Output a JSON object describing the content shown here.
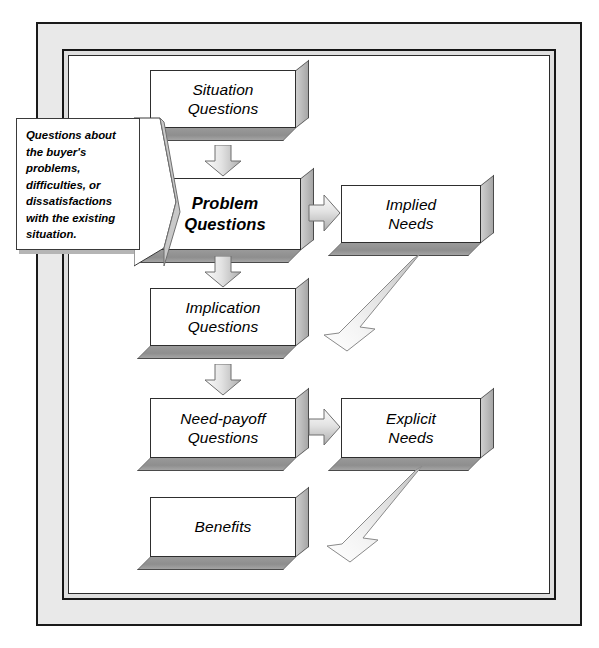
{
  "diagram": {
    "callout": {
      "text": "Questions about the buyer's problems, difficulties, or dissatisfactions with the existing situation."
    },
    "boxes": [
      {
        "id": "situation-questions",
        "line1": "Situation",
        "line2": "Questions",
        "emphasis": false
      },
      {
        "id": "problem-questions",
        "line1": "Problem",
        "line2": "Questions",
        "emphasis": true
      },
      {
        "id": "implication-questions",
        "line1": "Implication",
        "line2": "Questions",
        "emphasis": false
      },
      {
        "id": "need-payoff-questions",
        "line1": "Need-payoff",
        "line2": "Questions",
        "emphasis": false
      },
      {
        "id": "benefits",
        "line1": "Benefits",
        "line2": "",
        "emphasis": false
      },
      {
        "id": "implied-needs",
        "line1": "Implied",
        "line2": "Needs",
        "emphasis": false
      },
      {
        "id": "explicit-needs",
        "line1": "Explicit",
        "line2": "Needs",
        "emphasis": false
      }
    ],
    "connectors": [
      {
        "id": "arrow-situation-to-problem",
        "kind": "block-arrow-down"
      },
      {
        "id": "arrow-problem-to-implication",
        "kind": "block-arrow-down"
      },
      {
        "id": "arrow-implication-to-need-payoff",
        "kind": "block-arrow-down"
      },
      {
        "id": "arrow-problem-to-implied-needs",
        "kind": "block-arrow-right"
      },
      {
        "id": "arrow-need-payoff-to-explicit",
        "kind": "block-arrow-right"
      },
      {
        "id": "arrow-implied-needs-to-implication",
        "kind": "swoosh-arrow-down-left"
      },
      {
        "id": "arrow-explicit-needs-to-benefits",
        "kind": "swoosh-arrow-down-left"
      }
    ],
    "colors": {
      "frame_outer_fill": "#e9e9e9",
      "frame_mid_fill": "#dedede",
      "frame_border": "#1a1a1a",
      "canvas": "#ffffff",
      "box_face": "#ffffff",
      "box_side": "#b9b9b9",
      "box_bottom": "#8e8e8e",
      "arrow_fill_light": "#f2f2f2",
      "arrow_fill_dark": "#b0b0b0",
      "text": "#000000"
    }
  }
}
